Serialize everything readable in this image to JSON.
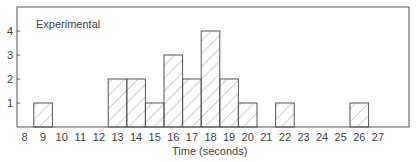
{
  "chart_data": {
    "type": "bar",
    "title": "",
    "annotation": "Experimental",
    "xlabel": "Time (seconds)",
    "ylabel": "",
    "x_ticks": [
      "8",
      "9",
      "10",
      "11",
      "12",
      "13",
      "14",
      "15",
      "16",
      "17",
      "18",
      "19",
      "20",
      "21",
      "22",
      "23",
      "24",
      "25",
      "26",
      "27"
    ],
    "y_ticks": [
      "1",
      "2",
      "3",
      "4"
    ],
    "ylim": [
      0,
      5
    ],
    "categories": [
      "9",
      "13",
      "14",
      "15",
      "16",
      "17",
      "18",
      "19",
      "20",
      "22",
      "26"
    ],
    "values": [
      1,
      2,
      2,
      1,
      3,
      2,
      4,
      2,
      1,
      1,
      1
    ],
    "fill_pattern": "diagonal hatch",
    "grid": false,
    "legend": null
  },
  "colors": {
    "line": "#444444",
    "hatch": "#777777",
    "background": "#ffffff"
  }
}
